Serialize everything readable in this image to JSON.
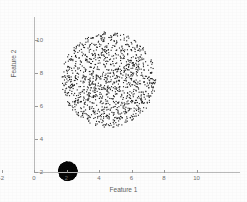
{
  "chart_data": {
    "type": "scatter",
    "title": "",
    "xlabel": "Feature 1",
    "ylabel": "Feature 2",
    "xlim": [
      -3.2,
      11.3
    ],
    "ylim": [
      1.3,
      11.6
    ],
    "xticks": [
      -2,
      0,
      2,
      4,
      6,
      8,
      10
    ],
    "xticklabels": [
      "-2",
      "0",
      "2",
      "4",
      "6",
      "8",
      "10"
    ],
    "yticks": [
      2,
      4,
      6,
      8,
      10
    ],
    "yticklabels": [
      "2",
      "4",
      "6",
      "8",
      "10"
    ],
    "grid": false,
    "legend": null,
    "marker_color": "#1a1a1a",
    "axis_color": "#b9b9b9",
    "background": "#ffffff",
    "series": [
      {
        "name": "sparse-disc-cluster",
        "shape": "disc",
        "center": [
          4.6,
          7.6
        ],
        "radius": 2.9,
        "n_points": 1200,
        "density": "uniform",
        "marker_size": 1.1,
        "color": "#1f1f1f",
        "seed": 20240517
      },
      {
        "name": "dense-disc-cluster",
        "shape": "disc",
        "center": [
          2.08,
          2.05
        ],
        "radius": 0.56,
        "n_points": 1400,
        "density": "uniform",
        "marker_size": 1.3,
        "color": "#0a0a0a",
        "seed": 771
      }
    ]
  },
  "axes": {
    "x_title": "Feature 1",
    "y_title": "Feature 2"
  }
}
